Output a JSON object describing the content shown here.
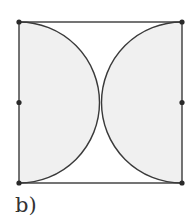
{
  "figure": {
    "label": "b)",
    "square": {
      "x": 19,
      "y": 22,
      "width": 163,
      "height": 161
    },
    "semicircles": [
      {
        "side": "left",
        "center": [
          19,
          102.5
        ],
        "radius": 80.5
      },
      {
        "side": "right",
        "center": [
          182,
          102.5
        ],
        "radius": 80.5
      }
    ],
    "points": [
      [
        19,
        22
      ],
      [
        182,
        22
      ],
      [
        19,
        102.5
      ],
      [
        182,
        102.5
      ],
      [
        19,
        183
      ],
      [
        182,
        183
      ]
    ],
    "colors": {
      "stroke": "#3a3a3a",
      "fill": "#f0f0f0",
      "point": "#2a2a2a"
    }
  }
}
